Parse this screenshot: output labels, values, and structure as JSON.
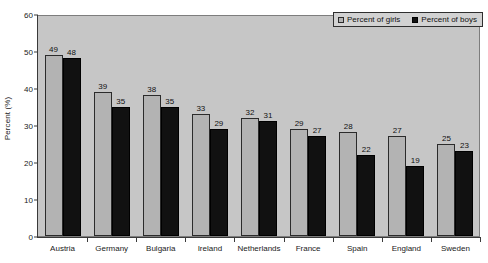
{
  "chart_data": {
    "type": "bar",
    "title": "",
    "subtitle": "",
    "xlabel": "",
    "ylabel": "Percent (%)",
    "ylim": [
      0,
      60
    ],
    "yticks": [
      0,
      10,
      20,
      30,
      40,
      50,
      60
    ],
    "grid": false,
    "legend_position": "top-right",
    "categories": [
      "Austria",
      "Germany",
      "Bulgaria",
      "Ireland",
      "Netherlands",
      "France",
      "Spain",
      "England",
      "Sweden"
    ],
    "series": [
      {
        "name": "Percent of girls",
        "color": "#b3b3b3",
        "values": [
          49,
          39,
          38,
          33,
          32,
          29,
          28,
          27,
          25
        ]
      },
      {
        "name": "Percent of boys",
        "color": "#111111",
        "values": [
          48,
          35,
          35,
          29,
          31,
          27,
          22,
          19,
          23
        ]
      }
    ],
    "data_labels": true
  },
  "legend": {
    "entries": [
      {
        "label": "Percent of girls"
      },
      {
        "label": "Percent of boys"
      }
    ]
  },
  "axes": {
    "y_title": "Percent (%)",
    "y_tick_labels": [
      "0",
      "10",
      "20",
      "30",
      "40",
      "50",
      "60"
    ],
    "x_tick_labels": [
      "Austria",
      "Germany",
      "Bulgaria",
      "Ireland",
      "Netherlands",
      "France",
      "Spain",
      "England",
      "Sweden"
    ]
  },
  "colors": {
    "plot_background": "#c6c6c6",
    "girls_bar": "#b3b3b3",
    "boys_bar": "#111111",
    "axis": "#3a3a3a",
    "text": "#1a1a1a"
  }
}
